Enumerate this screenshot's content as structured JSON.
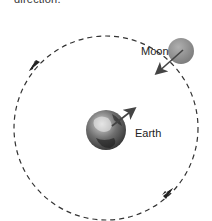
{
  "caption": {
    "text": "direction."
  },
  "diagram": {
    "orbit": {
      "style": "dashed",
      "direction": "counterclockwise",
      "color": "#333333"
    },
    "moon": {
      "label": "Moon",
      "color": "#8c8c8c",
      "velocity_arrow": "toward-earth"
    },
    "earth": {
      "label": "Earth",
      "velocity_arrow": "toward-moon"
    },
    "orbit_arrows": [
      "upper-left",
      "lower-right"
    ]
  }
}
